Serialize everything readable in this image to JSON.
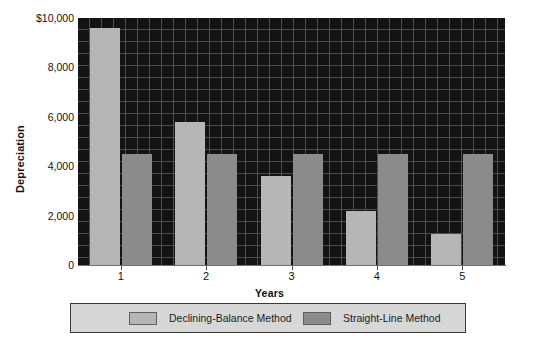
{
  "chart_data": {
    "type": "bar",
    "title": "",
    "xlabel": "Years",
    "ylabel": "Depreciation",
    "categories": [
      "1",
      "2",
      "3",
      "4",
      "5"
    ],
    "ylim": [
      0,
      10000
    ],
    "yticks": [
      0,
      2000,
      4000,
      6000,
      8000,
      10000
    ],
    "ytick_labels": [
      "0",
      "2,000",
      "4,000",
      "6,000",
      "8,000",
      "$10,000"
    ],
    "grid": true,
    "legend_position": "bottom",
    "series": [
      {
        "name": "Declining-Balance Method",
        "color": "#b6b6b6",
        "values": [
          9600,
          5800,
          3600,
          2200,
          1250
        ]
      },
      {
        "name": "Straight-Line Method",
        "color": "#8b8b8b",
        "values": [
          4500,
          4500,
          4500,
          4500,
          4500
        ]
      }
    ],
    "plot_background": "#131313",
    "grid_color": "#4d4d4d",
    "legend_background": "#d7d7d7",
    "legend_border": "#3a3a3a"
  }
}
